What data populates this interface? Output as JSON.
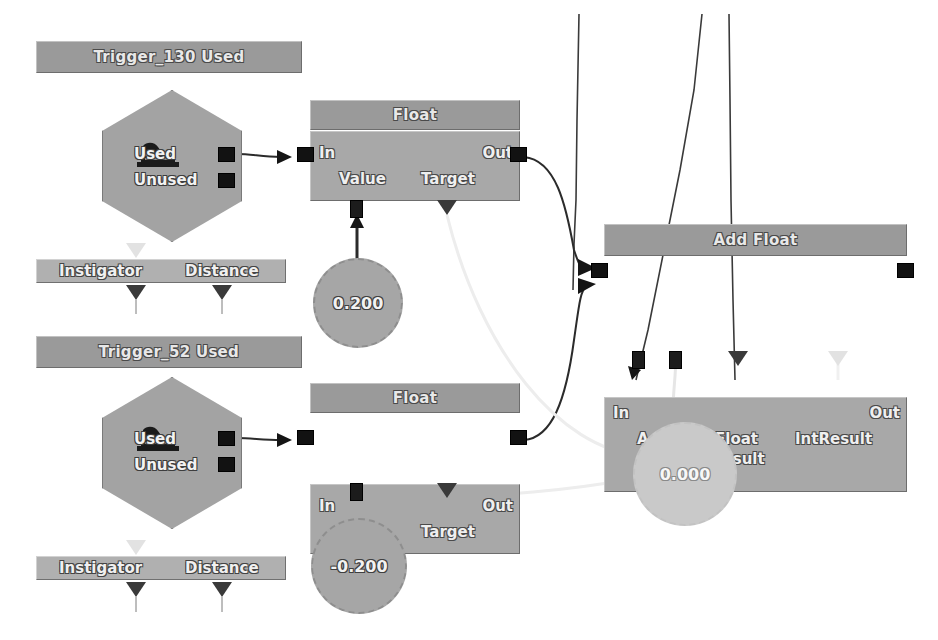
{
  "editor": {
    "name": "kismet-node-graph",
    "background": "#ffffff",
    "colors": {
      "node_title": "#9a9a9a",
      "node_body": "#a8a8a8",
      "event_node": "#a3a3a3",
      "bar_node": "#b0b0b0",
      "variable_node": "#a6a6a6",
      "variable_node_faded": "#c9c9c9",
      "connector": "#121212",
      "wire": "#2b2b2b",
      "wire_light": "#e6e6e6"
    }
  },
  "nodes": {
    "trigger_130": {
      "title": "Trigger_130 Used",
      "outputs": [
        "Used",
        "Unused"
      ],
      "icon": "trigger-icon"
    },
    "trigger_52": {
      "title": "Trigger_52 Used",
      "outputs": [
        "Used",
        "Unused"
      ],
      "icon": "trigger-icon"
    },
    "instigator_bar_top": {
      "labels": [
        "Instigator",
        "Distance"
      ]
    },
    "instigator_bar_bottom": {
      "labels": [
        "Instigator",
        "Distance"
      ]
    },
    "float_top": {
      "title": "Float",
      "input": "In",
      "output": "Out",
      "vars": [
        "Value",
        "Target"
      ]
    },
    "float_bottom": {
      "title": "Float",
      "input": "In",
      "output": "Out",
      "vars": [
        "Value",
        "Target"
      ]
    },
    "add_float": {
      "title": "Add Float",
      "input": "In",
      "output": "Out",
      "vars": [
        "A",
        "B",
        "Float Result",
        "IntResult"
      ],
      "var_float_result_line1": "Float",
      "var_float_result_line2": "Result",
      "var_int_result": "IntResult",
      "var_a": "A",
      "var_b": "B"
    }
  },
  "variables": {
    "value_top": "0.200",
    "value_bottom": "-0.200",
    "value_target": "0.000"
  }
}
